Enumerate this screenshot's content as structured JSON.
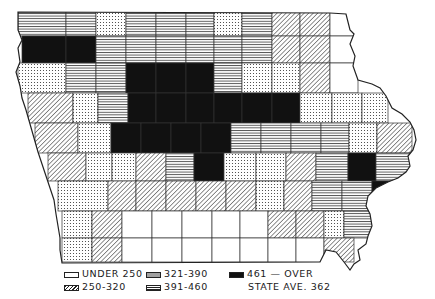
{
  "legend": {
    "under_250": "UNDER 250",
    "r250_320": "250-320",
    "r321_390": "321-390",
    "r391_460": "391-460",
    "r461_over": "461 — OVER",
    "state_average": "STATE AVE. 362"
  },
  "categories": {
    "U": {
      "label": "UNDER 250",
      "fill": "#ffffff"
    },
    "D": {
      "label": "250-320",
      "pattern": "diagonal"
    },
    "S": {
      "label": "321-390",
      "pattern": "stipple"
    },
    "H": {
      "label": "391-460",
      "pattern": "horizontal"
    },
    "B": {
      "label": "461 — OVER",
      "fill": "#111111"
    }
  },
  "map": {
    "region": "Iowa counties",
    "rows": [
      {
        "y": 12,
        "h": 24,
        "cells": [
          [
            18,
            48,
            "H"
          ],
          [
            66,
            30,
            "H"
          ],
          [
            96,
            30,
            "S"
          ],
          [
            126,
            30,
            "H"
          ],
          [
            156,
            30,
            "H"
          ],
          [
            186,
            28,
            "H"
          ],
          [
            214,
            28,
            "S"
          ],
          [
            242,
            30,
            "H"
          ],
          [
            272,
            28,
            "D"
          ],
          [
            300,
            30,
            "D"
          ],
          [
            330,
            28,
            "U"
          ]
        ]
      },
      {
        "y": 36,
        "h": 27,
        "cells": [
          [
            22,
            44,
            "B"
          ],
          [
            66,
            30,
            "B"
          ],
          [
            96,
            30,
            "H"
          ],
          [
            126,
            30,
            "H"
          ],
          [
            156,
            30,
            "H"
          ],
          [
            186,
            28,
            "H"
          ],
          [
            214,
            28,
            "H"
          ],
          [
            242,
            30,
            "H"
          ],
          [
            272,
            28,
            "D"
          ],
          [
            300,
            30,
            "D"
          ],
          [
            330,
            28,
            "U"
          ]
        ]
      },
      {
        "y": 63,
        "h": 30,
        "cells": [
          [
            18,
            48,
            "S"
          ],
          [
            66,
            30,
            "H"
          ],
          [
            96,
            30,
            "H"
          ],
          [
            126,
            30,
            "B"
          ],
          [
            156,
            30,
            "B"
          ],
          [
            186,
            28,
            "B"
          ],
          [
            214,
            28,
            "H"
          ],
          [
            242,
            30,
            "S"
          ],
          [
            272,
            28,
            "S"
          ],
          [
            300,
            30,
            "D"
          ],
          [
            330,
            28,
            "U"
          ]
        ]
      },
      {
        "y": 93,
        "h": 30,
        "cells": [
          [
            28,
            45,
            "D"
          ],
          [
            73,
            25,
            "S"
          ],
          [
            98,
            30,
            "H"
          ],
          [
            128,
            28,
            "B"
          ],
          [
            156,
            30,
            "B"
          ],
          [
            186,
            28,
            "B"
          ],
          [
            214,
            28,
            "B"
          ],
          [
            242,
            30,
            "B"
          ],
          [
            272,
            28,
            "B"
          ],
          [
            300,
            32,
            "S"
          ],
          [
            332,
            30,
            "S"
          ],
          [
            362,
            26,
            "S"
          ]
        ]
      },
      {
        "y": 123,
        "h": 30,
        "cells": [
          [
            35,
            43,
            "D"
          ],
          [
            78,
            33,
            "S"
          ],
          [
            111,
            30,
            "B"
          ],
          [
            141,
            30,
            "B"
          ],
          [
            171,
            30,
            "B"
          ],
          [
            201,
            30,
            "B"
          ],
          [
            231,
            30,
            "H"
          ],
          [
            261,
            30,
            "H"
          ],
          [
            291,
            30,
            "H"
          ],
          [
            321,
            28,
            "H"
          ],
          [
            349,
            28,
            "S"
          ],
          [
            377,
            35,
            "D"
          ]
        ]
      },
      {
        "y": 153,
        "h": 28,
        "cells": [
          [
            48,
            38,
            "D"
          ],
          [
            86,
            26,
            "S"
          ],
          [
            112,
            24,
            "S"
          ],
          [
            136,
            30,
            "D"
          ],
          [
            166,
            28,
            "H"
          ],
          [
            194,
            30,
            "B"
          ],
          [
            224,
            32,
            "S"
          ],
          [
            256,
            30,
            "S"
          ],
          [
            286,
            30,
            "D"
          ],
          [
            316,
            32,
            "H"
          ],
          [
            348,
            28,
            "B"
          ],
          [
            376,
            36,
            "H"
          ]
        ]
      },
      {
        "y": 181,
        "h": 30,
        "cells": [
          [
            58,
            50,
            "S"
          ],
          [
            108,
            28,
            "D"
          ],
          [
            136,
            30,
            "D"
          ],
          [
            166,
            30,
            "D"
          ],
          [
            196,
            30,
            "D"
          ],
          [
            226,
            30,
            "D"
          ],
          [
            256,
            28,
            "S"
          ],
          [
            284,
            28,
            "D"
          ],
          [
            312,
            30,
            "H"
          ],
          [
            342,
            30,
            "H"
          ],
          [
            372,
            22,
            "B"
          ]
        ]
      },
      {
        "y": 211,
        "h": 27,
        "cells": [
          [
            62,
            30,
            "S"
          ],
          [
            92,
            30,
            "D"
          ],
          [
            122,
            30,
            "U"
          ],
          [
            152,
            30,
            "U"
          ],
          [
            182,
            30,
            "U"
          ],
          [
            212,
            28,
            "U"
          ],
          [
            240,
            28,
            "U"
          ],
          [
            268,
            28,
            "D"
          ],
          [
            296,
            28,
            "D"
          ],
          [
            324,
            20,
            "S"
          ],
          [
            344,
            30,
            "H"
          ]
        ]
      },
      {
        "y": 238,
        "h": 24,
        "cells": [
          [
            62,
            30,
            "S"
          ],
          [
            92,
            30,
            "D"
          ],
          [
            122,
            30,
            "U"
          ],
          [
            152,
            30,
            "U"
          ],
          [
            182,
            30,
            "U"
          ],
          [
            212,
            28,
            "U"
          ],
          [
            240,
            28,
            "U"
          ],
          [
            268,
            28,
            "U"
          ],
          [
            296,
            28,
            "U"
          ],
          [
            324,
            30,
            "D"
          ]
        ]
      }
    ]
  }
}
